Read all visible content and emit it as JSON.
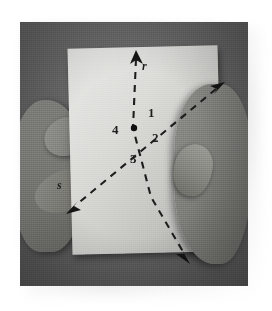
{
  "scene": {
    "title": "Photograph of two hands holding a sheet of paper with two dashed intersecting lines",
    "background_color": "#ffffff",
    "photo_background_color": "#666666",
    "paper_color": "#dadad7",
    "hand_color": "#7b7b78",
    "ink_color": "#1d1d1d"
  },
  "diagram": {
    "intersection_point": {
      "x": 115,
      "y": 105,
      "label": ""
    },
    "lines": [
      {
        "name": "line-r",
        "label": "r",
        "label_x": 124,
        "label_y": 45,
        "style": "dashed",
        "from_x": 113,
        "from_y": 128,
        "to_x": 116,
        "to_y": 35,
        "arrow_start": "bottom-arrow",
        "arrow_end": "top-arrow"
      },
      {
        "name": "line-s",
        "label": "s",
        "label_x": 40,
        "label_y": 163,
        "style": "dashed",
        "from_x": 160,
        "from_y": 70,
        "to_x": 55,
        "to_y": 182,
        "arrow_start": "top-right-arrow",
        "arrow_end": "bottom-left-arrow"
      }
    ],
    "angle_labels": [
      {
        "id": "1",
        "text": "1",
        "x": 128,
        "y": 93
      },
      {
        "id": "2",
        "text": "2",
        "x": 134,
        "y": 116
      },
      {
        "id": "3",
        "text": "3",
        "x": 114,
        "y": 136
      },
      {
        "id": "4",
        "text": "4",
        "x": 97,
        "y": 110
      }
    ],
    "arrowheads": [
      {
        "name": "arrowhead-top",
        "x": 116,
        "y": 33,
        "direction": "up"
      },
      {
        "name": "arrowhead-bottom",
        "x": 166,
        "y": 236,
        "direction": "down"
      },
      {
        "name": "arrowhead-top-right",
        "x": 199,
        "y": 64,
        "direction": "up-right"
      },
      {
        "name": "arrowhead-bottom-left",
        "x": 52,
        "y": 187,
        "direction": "down-left"
      }
    ]
  },
  "hands": {
    "left": {
      "name": "left-hand",
      "description": "left hand gripping the paper edge"
    },
    "right": {
      "name": "right-hand",
      "description": "right hand gripping the paper edge"
    }
  }
}
